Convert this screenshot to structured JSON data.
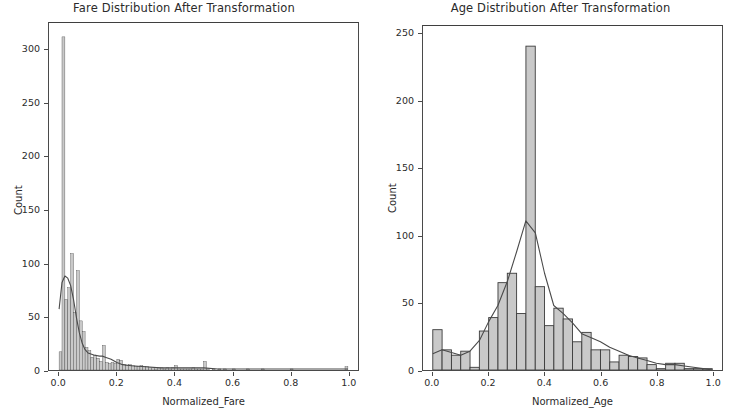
{
  "figure": {
    "width": 735,
    "height": 413,
    "background": "#ffffff",
    "bar_face_color": "#c9c9c9",
    "bar_edge_color": "#3a3a3a",
    "kde_line_color": "#4a4a4a",
    "axis_color": "#4a4a4a",
    "text_color": "#2b2b2b"
  },
  "panels": [
    {
      "id": "fare",
      "title": "Fare Distribution After Transformation",
      "xlabel": "Normalized_Fare",
      "ylabel": "Count"
    },
    {
      "id": "age",
      "title": "Age Distribution After Transformation",
      "xlabel": "Normalized_Age",
      "ylabel": "Count"
    }
  ],
  "chart_data": [
    {
      "type": "bar",
      "id": "fare-histogram",
      "title": "Fare Distribution After Transformation",
      "xlabel": "Normalized_Fare",
      "ylabel": "Count",
      "xlim": [
        -0.035,
        1.035
      ],
      "ylim": [
        0,
        325
      ],
      "xticks": [
        0.0,
        0.2,
        0.4,
        0.6,
        0.8,
        1.0
      ],
      "xticklabels": [
        "0.0",
        "0.2",
        "0.4",
        "0.6",
        "0.8",
        "1.0"
      ],
      "yticks": [
        0,
        50,
        100,
        150,
        200,
        250,
        300
      ],
      "yticklabels": [
        "0",
        "50",
        "100",
        "150",
        "200",
        "250",
        "300"
      ],
      "grid": false,
      "legend": null,
      "bin_width": 0.01,
      "bin_edges": [
        0.0,
        0.01,
        0.02,
        0.03,
        0.04,
        0.05,
        0.06,
        0.07,
        0.08,
        0.09,
        0.1,
        0.11,
        0.12,
        0.13,
        0.14,
        0.15,
        0.16,
        0.17,
        0.18,
        0.19,
        0.2,
        0.21,
        0.22,
        0.23,
        0.24,
        0.25,
        0.26,
        0.27,
        0.28,
        0.29,
        0.3,
        0.31,
        0.32,
        0.33,
        0.34,
        0.35,
        0.36,
        0.37,
        0.38,
        0.39,
        0.4,
        0.41,
        0.42,
        0.43,
        0.44,
        0.45,
        0.46,
        0.47,
        0.48,
        0.49,
        0.5,
        0.51,
        0.52,
        0.53,
        0.54,
        0.55,
        0.56,
        0.57,
        0.58,
        0.59,
        0.6,
        0.61,
        0.62,
        0.63,
        0.64,
        0.65,
        0.66,
        0.67,
        0.68,
        0.69,
        0.7,
        0.71,
        0.72,
        0.73,
        0.74,
        0.75,
        0.76,
        0.77,
        0.78,
        0.79,
        0.8,
        0.81,
        0.82,
        0.83,
        0.84,
        0.85,
        0.86,
        0.87,
        0.88,
        0.89,
        0.9,
        0.91,
        0.92,
        0.93,
        0.94,
        0.95,
        0.96,
        0.97,
        0.98,
        0.99,
        1.0
      ],
      "values": [
        17,
        312,
        66,
        77,
        109,
        54,
        93,
        46,
        36,
        21,
        18,
        12,
        14,
        11,
        8,
        23,
        7,
        6,
        7,
        6,
        10,
        9,
        5,
        4,
        5,
        4,
        3,
        3,
        4,
        3,
        3,
        2,
        2,
        1,
        2,
        2,
        1,
        2,
        1,
        2,
        4,
        1,
        1,
        1,
        1,
        1,
        2,
        1,
        1,
        1,
        8,
        1,
        0,
        1,
        0,
        1,
        0,
        1,
        0,
        0,
        1,
        0,
        0,
        0,
        0,
        1,
        0,
        0,
        0,
        0,
        1,
        0,
        0,
        0,
        0,
        0,
        0,
        0,
        0,
        0,
        1,
        0,
        0,
        0,
        0,
        0,
        0,
        0,
        0,
        0,
        0,
        0,
        0,
        0,
        0,
        0,
        0,
        0,
        0,
        3
      ],
      "kde": {
        "label": "kde",
        "x": [
          0.0,
          0.01,
          0.02,
          0.03,
          0.04,
          0.05,
          0.06,
          0.07,
          0.08,
          0.09,
          0.1,
          0.12,
          0.14,
          0.15,
          0.16,
          0.18,
          0.2,
          0.22,
          0.25,
          0.3,
          0.35,
          0.4,
          0.45,
          0.5,
          0.55,
          0.6,
          0.7,
          0.8,
          0.9,
          1.0
        ],
        "y": [
          57,
          82,
          88,
          86,
          79,
          66,
          49,
          35,
          25,
          19,
          16,
          14,
          13,
          13,
          12,
          10,
          7,
          5,
          4,
          3,
          2,
          2,
          2,
          2,
          1,
          1,
          1,
          1,
          1,
          1
        ]
      }
    },
    {
      "type": "bar",
      "id": "age-histogram",
      "title": "Age Distribution After Transformation",
      "xlabel": "Normalized_Age",
      "ylabel": "Count",
      "xlim": [
        -0.035,
        1.035
      ],
      "ylim": [
        0,
        256
      ],
      "xticks": [
        0.0,
        0.2,
        0.4,
        0.6,
        0.8,
        1.0
      ],
      "xticklabels": [
        "0.0",
        "0.2",
        "0.4",
        "0.6",
        "0.8",
        "1.0"
      ],
      "yticks": [
        0,
        50,
        100,
        150,
        200,
        250
      ],
      "yticklabels": [
        "0",
        "50",
        "100",
        "150",
        "200",
        "250"
      ],
      "grid": false,
      "legend": null,
      "bin_width": 0.0333,
      "bin_edges": [
        0.0,
        0.0333,
        0.0667,
        0.1,
        0.1333,
        0.1667,
        0.2,
        0.2333,
        0.2667,
        0.3,
        0.3333,
        0.3667,
        0.4,
        0.4333,
        0.4667,
        0.5,
        0.5333,
        0.5667,
        0.6,
        0.6333,
        0.6667,
        0.7,
        0.7333,
        0.7667,
        0.8,
        0.8333,
        0.8667,
        0.9,
        0.9333,
        0.9667,
        1.0
      ],
      "values": [
        30,
        15,
        11,
        14,
        2,
        29,
        39,
        65,
        72,
        42,
        241,
        62,
        33,
        46,
        38,
        21,
        28,
        15,
        15,
        6,
        11,
        10,
        9,
        4,
        1,
        5,
        5,
        1,
        1,
        1
      ],
      "kde": {
        "label": "kde",
        "x": [
          0.0,
          0.033,
          0.067,
          0.1,
          0.133,
          0.167,
          0.2,
          0.233,
          0.267,
          0.3,
          0.333,
          0.367,
          0.4,
          0.433,
          0.467,
          0.5,
          0.533,
          0.567,
          0.6,
          0.633,
          0.667,
          0.7,
          0.733,
          0.767,
          0.8,
          0.833,
          0.867,
          0.9,
          0.933,
          0.967,
          1.0
        ],
        "y": [
          12,
          15,
          13,
          11,
          14,
          22,
          36,
          48,
          66,
          88,
          111,
          102,
          72,
          48,
          42,
          35,
          27,
          24,
          21,
          17,
          14,
          11,
          9,
          7,
          5,
          4,
          4,
          3,
          2,
          1,
          0
        ]
      }
    }
  ]
}
